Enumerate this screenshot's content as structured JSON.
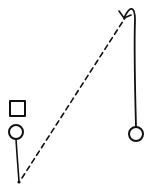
{
  "diagram": {
    "type": "sports-play-diagram",
    "stroke_color": "#111111",
    "background": "#ffffff",
    "elements": [
      {
        "kind": "square",
        "label": "player-square",
        "x": 9,
        "y": 101,
        "size": 16
      },
      {
        "kind": "circle",
        "label": "player-circle-left",
        "cx": 16,
        "cy": 132,
        "r": 7
      },
      {
        "kind": "circle",
        "label": "player-circle-right",
        "cx": 136,
        "cy": 134,
        "r": 7
      },
      {
        "kind": "solid-line",
        "label": "dribble-path-left",
        "from": [
          16,
          139
        ],
        "to": [
          19,
          182
        ]
      },
      {
        "kind": "dot",
        "label": "endpoint-dot",
        "cx": 19,
        "cy": 182,
        "r": 1.6
      },
      {
        "kind": "dashed-line",
        "label": "pass-line",
        "from": [
          21,
          179
        ],
        "to": [
          125,
          18
        ]
      },
      {
        "kind": "curved-arrow",
        "label": "cut-path-right",
        "from": [
          136,
          127
        ],
        "to": [
          124,
          19
        ]
      }
    ]
  }
}
